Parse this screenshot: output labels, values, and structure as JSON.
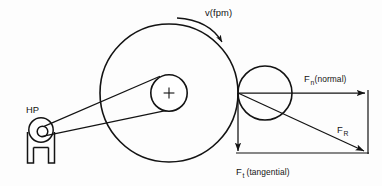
{
  "diagram": {
    "background_color": "#fdfdfd",
    "line_color": "#131313",
    "labels": {
      "motor": "HP",
      "velocity": "v(fpm)",
      "normal_force_symbol": "F",
      "normal_force_subscript": "n",
      "normal_force_qualifier": "(normal)",
      "tangential_force_symbol": "F",
      "tangential_force_subscript": "t",
      "tangential_force_qualifier": "(tangential)",
      "resultant_force_symbol": "F",
      "resultant_force_subscript": "R"
    },
    "components": {
      "motor_pulley": {
        "name": "HP motor with pulley",
        "center_x": 41,
        "center_y": 130,
        "outer_radius": 12,
        "hub_radius": 5.2
      },
      "drive_wheel": {
        "name": "Large driven wheel",
        "center_x": 169,
        "center_y": 93,
        "radius": 69,
        "hub_radius": 18
      },
      "work_roll": {
        "name": "Small work roll",
        "center_x": 265,
        "center_y": 93,
        "radius": 27
      },
      "contact_point": {
        "x": 238,
        "y": 93
      }
    },
    "vectors": {
      "normal": {
        "from_x": 238,
        "from_y": 93,
        "to_x": 366,
        "to_y": 93,
        "direction": "right"
      },
      "tangential": {
        "from_x": 238,
        "from_y": 93,
        "to_x": 238,
        "to_y": 152,
        "direction": "down"
      },
      "resultant": {
        "from_x": 238,
        "from_y": 93,
        "to_x": 366,
        "to_y": 152,
        "direction": "down-right"
      }
    },
    "rotation": {
      "direction": "clockwise",
      "annotation": "v(fpm)"
    }
  }
}
